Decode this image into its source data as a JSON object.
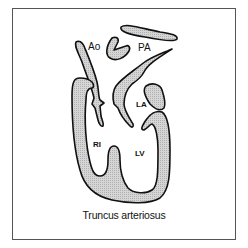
{
  "diagram": {
    "title": "Truncus arteriosus",
    "labels": {
      "ao": "Ao",
      "pa": "PA",
      "la": "LA",
      "rv": "RI",
      "lv": "LV"
    },
    "colors": {
      "fill": "#c8c8c8",
      "stroke": "#111111",
      "border": "#555555"
    }
  }
}
